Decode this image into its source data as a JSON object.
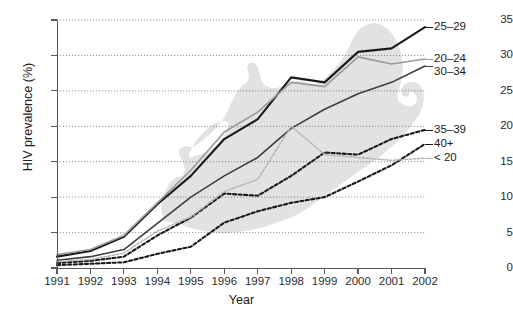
{
  "chart_data": {
    "type": "line",
    "title": "",
    "xlabel": "Year",
    "ylabel": "HIV prevalence (%)",
    "x": [
      1991,
      1992,
      1993,
      1994,
      1995,
      1996,
      1997,
      1998,
      1999,
      2000,
      2001,
      2002
    ],
    "xlim": [
      1991,
      2002
    ],
    "ylim": [
      0,
      35
    ],
    "yticks": [
      0,
      5,
      10,
      15,
      20,
      25,
      30,
      35
    ],
    "xticks": [
      "1991",
      "1992",
      "1993",
      "1994",
      "1995",
      "1996",
      "1997",
      "1998",
      "1999",
      "2000",
      "2001",
      "2002"
    ],
    "grid": "horizontal-dotted",
    "legend_position": "right-of-plot-line-ends",
    "background_annotation": "south-africa-map-silhouette",
    "series": [
      {
        "name": "25-29",
        "label": "25–29",
        "color": "#1a1a1a",
        "style": "solid",
        "width": 2.1,
        "values": [
          1.6,
          2.4,
          4.4,
          9.0,
          13.0,
          18.2,
          21.0,
          26.9,
          26.2,
          30.5,
          31.0,
          34.0
        ]
      },
      {
        "name": "20-24",
        "label": "20–24",
        "color": "#9a9a9a",
        "style": "solid",
        "width": 1.6,
        "values": [
          1.9,
          2.6,
          4.6,
          9.2,
          13.8,
          19.2,
          22.0,
          26.2,
          25.6,
          29.8,
          28.8,
          29.5
        ]
      },
      {
        "name": "30-34",
        "label": "30–34",
        "color": "#3d3d3d",
        "style": "solid",
        "width": 1.6,
        "values": [
          1.1,
          1.6,
          2.6,
          6.3,
          10.0,
          13.0,
          15.6,
          19.7,
          22.4,
          24.6,
          26.2,
          28.5
        ]
      },
      {
        "name": "35-39",
        "label": "35–39",
        "color": "#1a1a1a",
        "style": "dashed",
        "width": 2.1,
        "values": [
          0.7,
          1.0,
          1.6,
          4.6,
          7.1,
          10.5,
          10.2,
          13.0,
          16.3,
          16.0,
          18.2,
          19.5
        ]
      },
      {
        "name": "40+",
        "label": "40+",
        "color": "#1a1a1a",
        "style": "dashed",
        "width": 2.1,
        "values": [
          0.4,
          0.6,
          0.8,
          2.0,
          3.0,
          6.4,
          8.0,
          9.2,
          10.0,
          12.2,
          14.5,
          17.5
        ]
      },
      {
        "name": "under-20",
        "label": "< 20",
        "color": "#b5b5b5",
        "style": "dashed",
        "width": 1.5,
        "values": [
          0.9,
          1.2,
          2.1,
          5.2,
          7.2,
          10.8,
          12.5,
          20.0,
          16.0,
          15.6,
          15.2,
          15.5
        ]
      }
    ]
  },
  "caption": {
    "text": ""
  }
}
